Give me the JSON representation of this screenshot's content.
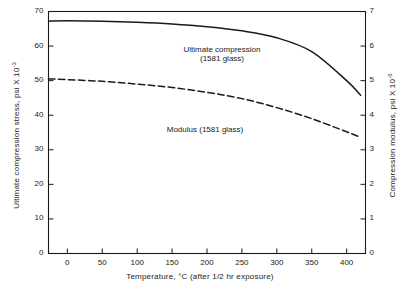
{
  "chart_data": {
    "type": "line",
    "title": "",
    "xlabel": "Temperature, °C (after 1/2 hr exposure)",
    "ylabel_left": "Ultimate compression stress, psi X 10",
    "ylabel_left_exp": "-3",
    "ylabel_right": "Compression modulus, psi X 10",
    "ylabel_right_exp": "-6",
    "xlim": [
      -27,
      427
    ],
    "ylim_left": [
      0,
      70
    ],
    "ylim_right": [
      0,
      7
    ],
    "grid": false,
    "legend": "annotations-inline",
    "xticks": [
      0,
      50,
      100,
      150,
      200,
      250,
      300,
      350,
      400
    ],
    "xticklabels": [
      "0",
      "50",
      "100",
      "150",
      "200",
      "250",
      "300",
      "350",
      "400"
    ],
    "yticks_left": [
      0,
      10,
      20,
      30,
      40,
      50,
      60,
      70
    ],
    "yticklabels_left": [
      "0",
      "10",
      "20",
      "30",
      "40",
      "50",
      "60",
      "70"
    ],
    "yticks_right": [
      0,
      1,
      2,
      3,
      4,
      5,
      6,
      7
    ],
    "yticklabels_right": [
      "0",
      "1",
      "2",
      "3",
      "4",
      "5",
      "6",
      "7"
    ],
    "series": [
      {
        "name": "Ultimate compression (1581 glass)",
        "axis": "left",
        "style": "solid",
        "color": "#1a1a1a",
        "x": [
          -27,
          0,
          50,
          100,
          150,
          200,
          250,
          300,
          350,
          400,
          420
        ],
        "y": [
          67.2,
          67.3,
          67.2,
          66.9,
          66.4,
          65.6,
          64.4,
          62.4,
          58.4,
          50.0,
          45.8
        ]
      },
      {
        "name": "Modulus (1581 glass)",
        "axis": "right",
        "style": "dashed",
        "color": "#1a1a1a",
        "x": [
          -27,
          0,
          50,
          100,
          150,
          200,
          250,
          300,
          350,
          400,
          420
        ],
        "y": [
          5.05,
          5.03,
          4.98,
          4.9,
          4.8,
          4.66,
          4.48,
          4.22,
          3.9,
          3.52,
          3.36
        ]
      }
    ],
    "annotations": [
      {
        "name": "ultimate-compression-label",
        "line1": "Ultimate compression",
        "line2": "(1581 glass)",
        "x_px": 222,
        "y_px": 45
      },
      {
        "name": "modulus-label",
        "line1": "Modulus (1581 glass)",
        "line2": "",
        "x_px": 205,
        "y_px": 125
      }
    ]
  }
}
